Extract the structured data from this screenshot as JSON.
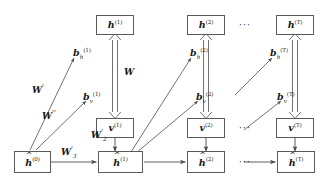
{
  "figure": {
    "type": "diagram",
    "box_stroke": "#5a5a5a",
    "line_stroke": "#4d4d4d",
    "background": "#ffffff",
    "text_color": "#1a1a1a"
  },
  "nodes": {
    "h_top": [
      {
        "name": "h1",
        "base": "h",
        "sup": "(1)"
      },
      {
        "name": "h2",
        "base": "h",
        "sup": "(2)"
      },
      {
        "name": "hT",
        "base": "h",
        "sup": "(T)"
      }
    ],
    "v_mid": [
      {
        "name": "v1",
        "base": "v",
        "sup": "(1)"
      },
      {
        "name": "v2",
        "base": "v",
        "sup": "(2)"
      },
      {
        "name": "vT",
        "base": "v",
        "sup": "(T)"
      }
    ],
    "hhat_bottom": [
      {
        "name": "hhat0",
        "base": "h",
        "sup": "(0)",
        "hat": "^"
      },
      {
        "name": "hhat1",
        "base": "h",
        "sup": "(1)",
        "hat": "^"
      },
      {
        "name": "hhat2",
        "base": "h",
        "sup": "(2)",
        "hat": "^"
      },
      {
        "name": "hhatT",
        "base": "h",
        "sup": "(T)",
        "hat": "^"
      }
    ]
  },
  "bias_labels": {
    "b_h": [
      {
        "name": "b_h_1",
        "base": "b",
        "sub": "h",
        "sup": "(1)"
      },
      {
        "name": "b_h_2",
        "base": "b",
        "sub": "h",
        "sup": "(2)"
      },
      {
        "name": "b_h_T",
        "base": "b",
        "sub": "h",
        "sup": "(T)"
      }
    ],
    "b_v": [
      {
        "name": "b_v_1",
        "base": "b",
        "sub": "v",
        "sup": "(1)"
      },
      {
        "name": "b_v_2",
        "base": "b",
        "sub": "v",
        "sup": "(2)"
      },
      {
        "name": "b_v_T",
        "base": "b",
        "sub": "v",
        "sup": "(T)"
      }
    ]
  },
  "weight_labels": [
    {
      "name": "W",
      "base": "W",
      "prime": "",
      "sub": ""
    },
    {
      "name": "W_prime",
      "base": "W",
      "prime": "'",
      "sub": ""
    },
    {
      "name": "W_dprime",
      "base": "W",
      "prime": "''",
      "sub": ""
    },
    {
      "name": "W_prime_2",
      "base": "W",
      "prime": "'",
      "sub": "2"
    },
    {
      "name": "W_prime_3",
      "base": "W",
      "prime": "'",
      "sub": "3"
    }
  ],
  "ellipses": [
    {
      "name": "ellipsis-top",
      "text": "···"
    },
    {
      "name": "ellipsis-mid",
      "text": "···"
    },
    {
      "name": "ellipsis-bottom",
      "text": "···"
    }
  ]
}
